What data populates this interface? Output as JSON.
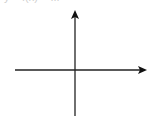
{
  "diagram": {
    "type": "coordinate-axes",
    "caption": "y = f(x) = ...",
    "axis_color": "#222222",
    "x_axis": {
      "y": 70,
      "x_start": 15,
      "x_end": 147,
      "arrow": "right"
    },
    "y_axis": {
      "x": 75,
      "y_start": 116,
      "y_end": 10,
      "arrow": "up"
    }
  }
}
